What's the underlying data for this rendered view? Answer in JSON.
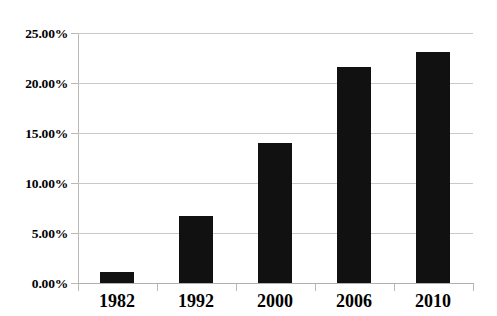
{
  "chart_data": {
    "type": "bar",
    "title": "",
    "subtitle": "",
    "xlabel": "",
    "ylabel": "",
    "categories": [
      "1982",
      "1992",
      "2000",
      "2006",
      "2010"
    ],
    "values": [
      1.1,
      6.7,
      14.0,
      21.6,
      23.1
    ],
    "value_labels": [
      "1.10%",
      "6.70%",
      "14.00%",
      "21.60%",
      "23.10%"
    ],
    "ylim": [
      0,
      25
    ],
    "ytick_values": [
      0,
      5,
      10,
      15,
      20,
      25
    ],
    "ytick_labels": [
      "0.00%",
      "5.00%",
      "10.00%",
      "15.00%",
      "20.00%",
      "25.00%"
    ],
    "grid": true,
    "grid_axis": "y",
    "legend": false,
    "legend_position": "none",
    "series": [
      {
        "name": "",
        "color": "#111111",
        "values": [
          1.1,
          6.7,
          14.0,
          21.6,
          23.1
        ]
      }
    ],
    "annotations": []
  },
  "colors": {
    "bar": "#111111",
    "gridline": "#c9c9c9",
    "axis": "#b0b0b0",
    "background": "#ffffff",
    "text": "#000000"
  }
}
